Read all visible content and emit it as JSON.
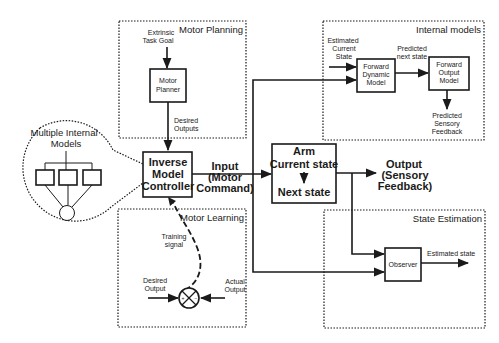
{
  "regions": {
    "motor_planning": "Motor Planning",
    "internal_models": "Internal models",
    "motor_learning": "Motor Learning",
    "state_estimation": "State Estimation"
  },
  "zoom_callout": {
    "title_line1": "Multiple Internal",
    "title_line2": "Models",
    "sub_model_count": 3
  },
  "blocks": {
    "motor_planner": [
      "Motor",
      "Planner"
    ],
    "inverse_model": [
      "Inverse",
      "Model",
      "Controller"
    ],
    "arm": {
      "title": "Arm",
      "line1": "Current state",
      "line2": "Next state"
    },
    "forward_dynamic": [
      "Forward",
      "Dynamic",
      "Model"
    ],
    "forward_output": [
      "Forward",
      "Output",
      "Model"
    ],
    "observer": "Observer"
  },
  "signals": {
    "task_goal": [
      "Extrinsic",
      "Task Goal"
    ],
    "desired_outputs": [
      "Desired",
      "Outputs"
    ],
    "input": [
      "Input",
      "(Motor",
      "Command)"
    ],
    "output": [
      "Output",
      "(Sensory",
      "Feedback)"
    ],
    "estimated_current_state": [
      "Estimated",
      "Current",
      "State"
    ],
    "predicted_next_state": [
      "Predicted",
      "next state"
    ],
    "predicted_sensory_feedback": [
      "Predicted",
      "Sensory",
      "Feedback"
    ],
    "training_signal": [
      "Training",
      "signal"
    ],
    "desired_output": [
      "Desired",
      "Output"
    ],
    "actual_output": [
      "Actual",
      "Output"
    ],
    "estimated_state": "Estimated state",
    "sum_plus": "+",
    "sum_minus": "−"
  }
}
